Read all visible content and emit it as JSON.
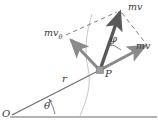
{
  "figure": {
    "name": "momentum-vector-decomposition-diagram",
    "width": 158,
    "height": 127,
    "background_color": "#ffffff"
  },
  "labels": {
    "momentum_total": "mv",
    "momentum_theta_base": "mv",
    "momentum_theta_sub": "θ",
    "momentum_radial": "mv",
    "angle_phi": "φ",
    "angle_theta": "θ",
    "radius": "r",
    "point_p": "P",
    "origin_o": "O"
  },
  "colors": {
    "vector_main": "#59595b",
    "vector_component": "#8a8a8c",
    "radial_line": "#6e6e70",
    "baseline": "#9a9a9c",
    "dashed": "#6b6b6d",
    "trajectory": "#b4b4b6",
    "text": "#3a3a3a",
    "point_marker": "#9d9d9f"
  },
  "geometry": {
    "origin": {
      "x": 12,
      "y": 115
    },
    "point_p": {
      "x": 100,
      "y": 70
    },
    "tip_momentum_total": {
      "x": 120,
      "y": 10
    },
    "tip_momentum_theta": {
      "x": 70,
      "y": 39
    },
    "tip_momentum_radial": {
      "x": 148,
      "y": 44
    },
    "baseline_y": 117,
    "theta_degrees": 27,
    "phi_degrees": 43
  },
  "elements": {
    "vectors": [
      {
        "name": "momentum-total-vector",
        "label": "mv",
        "style": "solid-thick"
      },
      {
        "name": "momentum-theta-vector",
        "label": "mvθ",
        "style": "solid-medium"
      },
      {
        "name": "momentum-radial-vector",
        "label": "mv",
        "style": "solid-medium"
      }
    ],
    "construction_lines": [
      {
        "name": "dashed-parallelogram-left"
      },
      {
        "name": "dashed-parallelogram-right"
      }
    ],
    "arcs": [
      {
        "name": "phi-angle-arc"
      },
      {
        "name": "theta-angle-arc"
      }
    ],
    "curves": [
      {
        "name": "trajectory-curve"
      }
    ]
  }
}
